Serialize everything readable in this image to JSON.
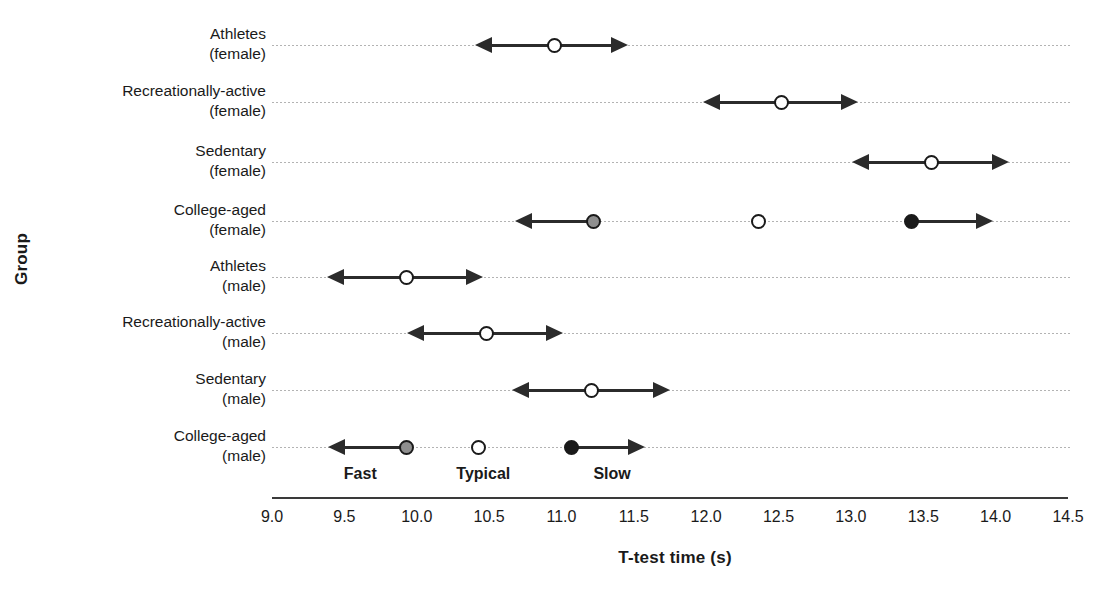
{
  "chart_data": {
    "type": "scatter",
    "title": "",
    "xlabel": "T-test time (s)",
    "ylabel": "Group",
    "xlim": [
      9.0,
      14.5
    ],
    "xticks": [
      "9.0",
      "9.5",
      "10.0",
      "10.5",
      "11.0",
      "11.5",
      "12.0",
      "12.5",
      "13.0",
      "13.5",
      "14.0",
      "14.5"
    ],
    "grid": true,
    "legend_position": "none",
    "zone_labels": [
      {
        "label": "Fast",
        "x": 9.61
      },
      {
        "label": "Typical",
        "x": 10.46
      },
      {
        "label": "Slow",
        "x": 11.35
      }
    ],
    "categories": [
      "Athletes (female)",
      "Recreationally-active (female)",
      "Sedentary (female)",
      "College-aged (female)",
      "Athletes (male)",
      "Recreationally-active (male)",
      "Sedentary (male)",
      "College-aged (male)"
    ],
    "rows": [
      {
        "group": "Athletes",
        "sex": "(female)",
        "markers": [
          {
            "value": 10.95,
            "style": "open",
            "name": "typical-marker"
          }
        ],
        "arrows": [
          {
            "from": 10.95,
            "to": 10.4,
            "direction": "left"
          },
          {
            "from": 10.95,
            "to": 11.46,
            "direction": "right"
          }
        ]
      },
      {
        "group": "Recreationally-active",
        "sex": "(female)",
        "markers": [
          {
            "value": 12.52,
            "style": "open",
            "name": "typical-marker"
          }
        ],
        "arrows": [
          {
            "from": 12.52,
            "to": 11.98,
            "direction": "left"
          },
          {
            "from": 12.52,
            "to": 13.05,
            "direction": "right"
          }
        ]
      },
      {
        "group": "Sedentary",
        "sex": "(female)",
        "markers": [
          {
            "value": 13.56,
            "style": "open",
            "name": "typical-marker"
          }
        ],
        "arrows": [
          {
            "from": 13.56,
            "to": 13.01,
            "direction": "left"
          },
          {
            "from": 13.56,
            "to": 14.09,
            "direction": "right"
          }
        ]
      },
      {
        "group": "College-aged",
        "sex": "(female)",
        "markers": [
          {
            "value": 11.22,
            "style": "gray",
            "name": "fast-marker"
          },
          {
            "value": 12.36,
            "style": "open",
            "name": "typical-marker"
          },
          {
            "value": 13.42,
            "style": "filled",
            "name": "slow-marker"
          }
        ],
        "arrows": [
          {
            "from": 11.22,
            "to": 10.68,
            "direction": "left"
          },
          {
            "from": 13.42,
            "to": 13.98,
            "direction": "right"
          }
        ]
      },
      {
        "group": "Athletes",
        "sex": "(male)",
        "markers": [
          {
            "value": 9.93,
            "style": "open",
            "name": "typical-marker"
          }
        ],
        "arrows": [
          {
            "from": 9.93,
            "to": 9.38,
            "direction": "left"
          },
          {
            "from": 9.93,
            "to": 10.46,
            "direction": "right"
          }
        ]
      },
      {
        "group": "Recreationally-active",
        "sex": "(male)",
        "markers": [
          {
            "value": 10.48,
            "style": "open",
            "name": "typical-marker"
          }
        ],
        "arrows": [
          {
            "from": 10.48,
            "to": 9.93,
            "direction": "left"
          },
          {
            "from": 10.48,
            "to": 11.01,
            "direction": "right"
          }
        ]
      },
      {
        "group": "Sedentary",
        "sex": "(male)",
        "markers": [
          {
            "value": 11.21,
            "style": "open",
            "name": "typical-marker"
          }
        ],
        "arrows": [
          {
            "from": 11.21,
            "to": 10.66,
            "direction": "left"
          },
          {
            "from": 11.21,
            "to": 11.75,
            "direction": "right"
          }
        ]
      },
      {
        "group": "College-aged",
        "sex": "(male)",
        "markers": [
          {
            "value": 9.93,
            "style": "gray",
            "name": "fast-marker"
          },
          {
            "value": 10.43,
            "style": "open",
            "name": "typical-marker"
          },
          {
            "value": 11.07,
            "style": "filled",
            "name": "slow-marker"
          }
        ],
        "arrows": [
          {
            "from": 9.93,
            "to": 9.39,
            "direction": "left"
          },
          {
            "from": 11.07,
            "to": 11.58,
            "direction": "right"
          }
        ]
      }
    ]
  },
  "colors": {
    "marker_open": "#ffffff",
    "marker_gray": "#8f8f8f",
    "marker_filled": "#1a1a1a",
    "line": "#2b2b2b",
    "grid": "#9a9a9a",
    "axis": "#3a3a3a"
  }
}
